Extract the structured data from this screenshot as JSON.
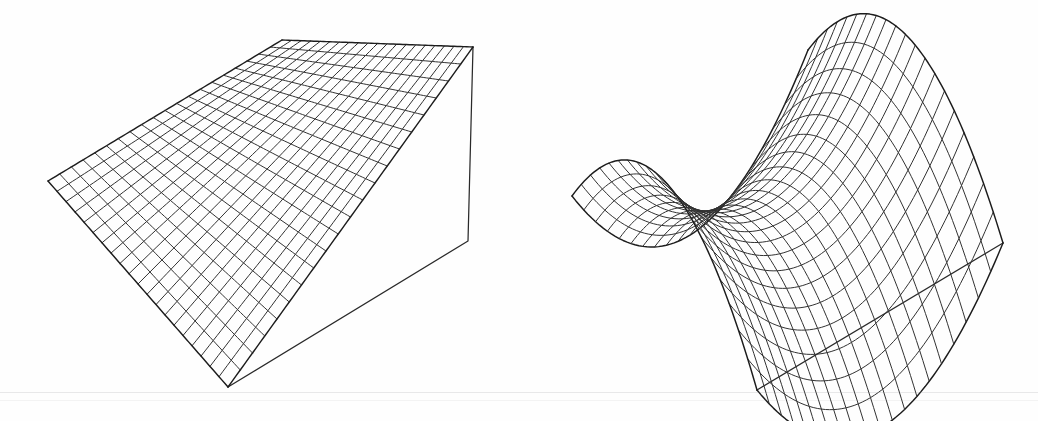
{
  "figure": {
    "title": "",
    "background_color": "#fefefe",
    "ink_color": "#2a2a2a",
    "width": 1038,
    "height": 421,
    "panel_count": 2
  },
  "chart_data": {
    "type": "line",
    "title": "",
    "subtitle": "",
    "xlabel": "",
    "ylabel": "",
    "zlabel": "",
    "render_style": "wireframe-mesh-3d",
    "legend": [],
    "grid": false,
    "axes_visible": false,
    "tick_labels": [],
    "annotations": [],
    "projection": {
      "type": "parallel-oblique",
      "u_divisions": 20,
      "v_divisions": 20
    },
    "panels": [
      {
        "id": "left",
        "name": "flat-plane-surface",
        "caption": "",
        "surface": "plane",
        "equation": "z = 0",
        "xlim": [
          -1,
          1
        ],
        "ylim": [
          -1,
          1
        ],
        "zlim": [
          -1,
          1
        ],
        "amplitude": 0.0,
        "screen_corners": {
          "left": [
            48,
            181
          ],
          "top": [
            282,
            40
          ],
          "right": [
            473,
            47
          ],
          "bottom": [
            228,
            387
          ]
        },
        "box_corners": {
          "bottom": [
            228,
            387
          ],
          "right": [
            468,
            241
          ],
          "top": [
            473,
            47
          ]
        },
        "series": [
          {
            "name": "u-isolines",
            "count": 21
          },
          {
            "name": "v-isolines",
            "count": 21
          }
        ]
      },
      {
        "id": "right",
        "name": "saddle-surface",
        "caption": "",
        "surface": "hyperbolic-paraboloid",
        "equation": "z = x^2 - y^2",
        "xlim": [
          -1,
          1
        ],
        "ylim": [
          -1,
          1
        ],
        "zlim": [
          -1,
          1
        ],
        "amplitude": 1.0,
        "screen_corners": {
          "left": [
            572,
            196
          ],
          "top": [
            808,
            50
          ],
          "right": [
            1003,
            243
          ],
          "bottom": [
            757,
            390
          ]
        },
        "box_corners": {
          "bottom": [
            757,
            390
          ],
          "right": [
            1003,
            243
          ],
          "top": [
            1003,
            243
          ]
        },
        "series": [
          {
            "name": "u-isolines",
            "count": 21
          },
          {
            "name": "v-isolines",
            "count": 21
          }
        ]
      }
    ]
  }
}
